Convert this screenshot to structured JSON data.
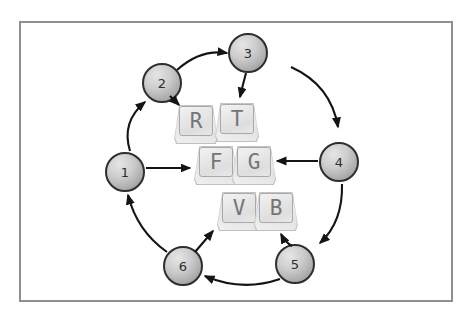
{
  "diagram": {
    "nodes": [
      {
        "label": "1"
      },
      {
        "label": "2"
      },
      {
        "label": "3"
      },
      {
        "label": "4"
      },
      {
        "label": "5"
      },
      {
        "label": "6"
      }
    ],
    "keys": [
      {
        "label": "R"
      },
      {
        "label": "T"
      },
      {
        "label": "F"
      },
      {
        "label": "G"
      },
      {
        "label": "V"
      },
      {
        "label": "B"
      }
    ],
    "colors": {
      "frame_border": "#8f8f8f",
      "node_fill_light": "#e6e6e6",
      "node_fill_dark": "#8f8f8f",
      "node_border": "#2e2e2e",
      "arrow": "#141414",
      "key_face": "#e8e8e8",
      "key_letter": "#757575",
      "background": "#ffffff"
    }
  }
}
